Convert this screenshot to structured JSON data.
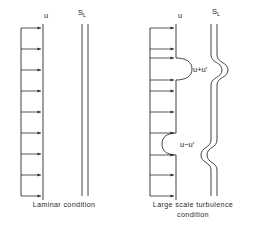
{
  "figure": {
    "line_color": "#2b2b2b",
    "text_color": "#1a1a1a",
    "background": "#ffffff",
    "panels": [
      {
        "id": "laminar",
        "caption": "Laminar condition",
        "velocity_label": "u",
        "flame_label": "S",
        "flame_label_subscript": "L",
        "arrow_count": 8,
        "flame_front_shape": "straight",
        "perturbation_labels": []
      },
      {
        "id": "turbulent",
        "caption_line1": "Large scale turbulence",
        "caption_line2": "condition",
        "caption": "Large scale turbulence condition",
        "velocity_label": "u",
        "flame_label": "S",
        "flame_label_subscript": "L",
        "arrow_count": 8,
        "flame_front_shape": "wrinkled",
        "perturbation_labels": [
          {
            "id": "bulge-upper",
            "text": "u+u′",
            "direction": "convex"
          },
          {
            "id": "bulge-lower",
            "text": "u−u′",
            "direction": "concave"
          }
        ]
      }
    ]
  }
}
